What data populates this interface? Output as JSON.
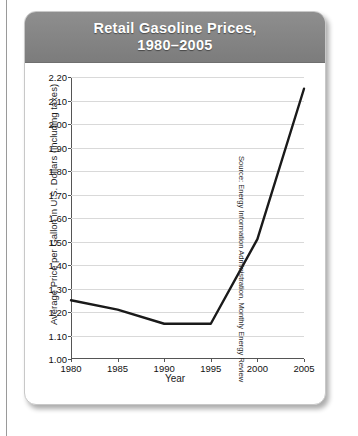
{
  "page": {
    "source_note": "Source: Energy Information Administration, Monthly Energy Review"
  },
  "card": {
    "title": "Retail Gasoline Prices,\n1980–2005"
  },
  "chart_data": {
    "type": "line",
    "title": "Retail Gasoline Prices, 1980–2005",
    "subtitle": "",
    "xlabel": "Year",
    "ylabel": "Average Price per Gallon in U.S. Dollars (including taxes)",
    "x": [
      1980,
      1985,
      1990,
      1995,
      2000,
      2005
    ],
    "values": [
      1.25,
      1.21,
      1.15,
      1.15,
      1.51,
      2.15
    ],
    "xtick_labels": [
      "1980",
      "1985",
      "1990",
      "1995",
      "2000",
      "2005"
    ],
    "ytick_labels": [
      "1.00",
      "1.10",
      "1.20",
      "1.30",
      "1.40",
      "1.50",
      "1.60",
      "1.70",
      "1.80",
      "1.90",
      "2.00",
      "2.10",
      "2.20"
    ],
    "yticks": [
      1.0,
      1.1,
      1.2,
      1.3,
      1.4,
      1.5,
      1.6,
      1.7,
      1.8,
      1.9,
      2.0,
      2.1,
      2.2
    ],
    "xlim": [
      1980,
      2005
    ],
    "ylim": [
      1.0,
      2.2
    ],
    "grid": "horizontal",
    "legend": "none",
    "line_color": "#1a1a1a",
    "grid_color": "#d9d9d9",
    "header_color": "#848484",
    "title_color": "#ffffff"
  }
}
